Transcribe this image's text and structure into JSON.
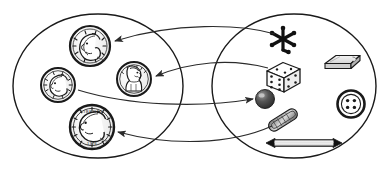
{
  "diagram": {
    "type": "set-mapping-diagram",
    "background_color": "#ffffff",
    "stroke_color": "#1a1a1a",
    "sets": [
      {
        "id": "left-set",
        "name": "coins-set",
        "label": "",
        "shape": "ellipse",
        "cx": 98,
        "cy": 86,
        "rx": 85,
        "ry": 72,
        "members": [
          {
            "id": "nickel",
            "name": "nickel-coin",
            "label": "nickel",
            "cx": 90,
            "cy": 46,
            "r": 20
          },
          {
            "id": "dime",
            "name": "dime-coin",
            "label": "dime",
            "cx": 58,
            "cy": 85,
            "r": 17
          },
          {
            "id": "penny",
            "name": "penny-coin",
            "label": "penny",
            "cx": 134,
            "cy": 79,
            "r": 17
          },
          {
            "id": "quarter",
            "name": "quarter-coin",
            "label": "quarter",
            "cx": 92,
            "cy": 127,
            "r": 22
          }
        ]
      },
      {
        "id": "right-set",
        "name": "objects-set",
        "label": "",
        "shape": "ellipse",
        "cx": 294,
        "cy": 86,
        "rx": 82,
        "ry": 72,
        "members": [
          {
            "id": "jack",
            "name": "jack-star",
            "label": "jack",
            "cx": 283,
            "cy": 39
          },
          {
            "id": "eraser",
            "name": "eraser",
            "label": "eraser",
            "cx": 342,
            "cy": 62
          },
          {
            "id": "die",
            "name": "die-cube",
            "label": "die",
            "cx": 283,
            "cy": 74
          },
          {
            "id": "marble",
            "name": "marble-sphere",
            "label": "marble",
            "cx": 265,
            "cy": 99
          },
          {
            "id": "button",
            "name": "button-4hole",
            "label": "button",
            "cx": 351,
            "cy": 104
          },
          {
            "id": "paperclip",
            "name": "paper-clip",
            "label": "paper clip",
            "cx": 283,
            "cy": 120
          },
          {
            "id": "pencil",
            "name": "double-arrow-pencil",
            "label": "pencil",
            "cx": 304,
            "cy": 143
          }
        ]
      }
    ],
    "mappings": [
      {
        "id": "m1",
        "name": "arrow-jack-to-nickel",
        "from": "jack",
        "to": "nickel",
        "direction": "right-to-left"
      },
      {
        "id": "m2",
        "name": "arrow-die-to-penny",
        "from": "die",
        "to": "penny",
        "direction": "right-to-left"
      },
      {
        "id": "m3",
        "name": "arrow-dime-to-marble",
        "from": "dime",
        "to": "marble",
        "direction": "left-to-right"
      },
      {
        "id": "m4",
        "name": "arrow-paperclip-to-quarter",
        "from": "paperclip",
        "to": "quarter",
        "direction": "right-to-left"
      }
    ],
    "colors": {
      "outline": "#1a1a1a",
      "arrow": "#333333",
      "coin_fill": "#ffffff",
      "coin_detail": "#222222",
      "marble_dark": "#3a3a3a",
      "marble_light": "#b8b8b8",
      "eraser_fill": "#dcdcdc",
      "die_fill": "#fafafa",
      "pencil_body": "#f2f2f2",
      "pencil_tip": "#111111"
    }
  }
}
